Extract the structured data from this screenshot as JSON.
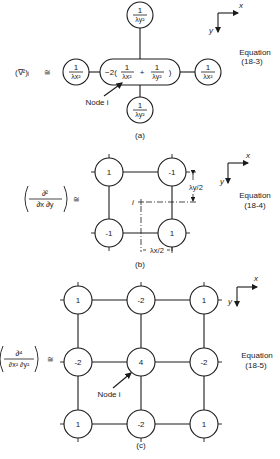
{
  "panel_a": {
    "lhs": "(∇²)ᵢ",
    "approx": "≅",
    "center_coef": "−2(",
    "plus": "+",
    "close": ")",
    "one": "1",
    "lx2": "λx²",
    "ly2": "λy²",
    "node_label": "Node i",
    "equation_label": "Equation",
    "equation_num": "(18-3)",
    "caption": "(a)",
    "axis_x": "x",
    "axis_y": "y"
  },
  "panel_b": {
    "lhs_num": "∂²",
    "lhs_den": "∂x ∂y",
    "approx": "≅",
    "values": [
      "1",
      "-1",
      "-1",
      "1"
    ],
    "center_label": "i",
    "dim_y": "λy/2",
    "dim_x": "λx/2",
    "equation_label": "Equation",
    "equation_num": "(18-4)",
    "caption": "(b)",
    "axis_x": "x",
    "axis_y": "y"
  },
  "panel_c": {
    "lhs_num": "∂⁴",
    "lhs_den": "∂x² ∂y²",
    "approx": "≅",
    "values": [
      "1",
      "-2",
      "1",
      "-2",
      "4",
      "-2",
      "1",
      "-2",
      "1"
    ],
    "node_label": "Node i",
    "equation_label": "Equation",
    "equation_num": "(18-5)",
    "caption": "(c)",
    "axis_x": "x",
    "axis_y": "y"
  }
}
